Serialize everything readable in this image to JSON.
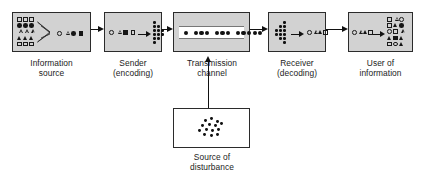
{
  "diagram": {
    "background": "#ffffff",
    "box_fill": "#d2d2d2",
    "box_fill_alt": "#ffffff",
    "stroke": "#2b2b2b",
    "glyph_color": "#151515"
  },
  "stages": [
    {
      "id": "information-source",
      "caption": "Information\nsource",
      "box": {
        "x": 12,
        "y": 12,
        "w": 79,
        "h": 40,
        "fill": "#d2d2d2"
      },
      "caption_pos": {
        "x": 12,
        "y": 58,
        "w": 79
      },
      "content_kind": "symbol-grid-funnel-stream",
      "grid": {
        "x": 4,
        "y": 4,
        "cols": 3,
        "rows": 5,
        "cell": 6.2,
        "symbols": [
          "sq-o",
          "sq-o",
          "sq-o",
          "ci-f",
          "ci-f",
          "ci-f",
          "tr-o",
          "tr-o",
          "tr-o",
          "tr-f",
          "tr-f",
          "tr-f",
          "sq-o",
          "sq-o",
          "sq-o"
        ]
      },
      "stream": [
        "ci-o",
        "tr-o",
        "ci-f",
        "sq-f"
      ]
    },
    {
      "id": "sender-encoding",
      "caption": "Sender\n(encoding)",
      "box": {
        "x": 104,
        "y": 12,
        "w": 58,
        "h": 40,
        "fill": "#d2d2d2"
      },
      "caption_pos": {
        "x": 104,
        "y": 58,
        "w": 58
      },
      "content_kind": "symbols-arrow-dotfan",
      "stream": [
        "ci-o",
        "tr-o",
        "sq-f",
        "sq-o"
      ],
      "fan_direction": "right"
    },
    {
      "id": "transmission-channel",
      "caption": "Transmission\nchannel",
      "box": {
        "x": 173,
        "y": 12,
        "w": 77,
        "h": 40,
        "fill": "#d2d2d2"
      },
      "caption_pos": {
        "x": 169,
        "y": 58,
        "w": 86
      },
      "content_kind": "signal-band",
      "dot_groups": [
        1,
        3,
        3,
        5
      ]
    },
    {
      "id": "receiver-decoding",
      "caption": "Receiver\n(decoding)",
      "box": {
        "x": 268,
        "y": 12,
        "w": 58,
        "h": 40,
        "fill": "#d2d2d2"
      },
      "caption_pos": {
        "x": 268,
        "y": 58,
        "w": 58
      },
      "content_kind": "dotfan-arrow-symbols",
      "stream": [
        "ci-o",
        "tr-o",
        "tr-f",
        "sq-o"
      ],
      "fan_direction": "left"
    },
    {
      "id": "user-of-information",
      "caption": "User of\ninformation",
      "box": {
        "x": 348,
        "y": 12,
        "w": 65,
        "h": 40,
        "fill": "#d2d2d2"
      },
      "caption_pos": {
        "x": 348,
        "y": 58,
        "w": 65
      },
      "content_kind": "symbols-arrow-grid",
      "stream": [
        "ci-o",
        "tr-o",
        "tr-f",
        "sq-o"
      ],
      "grid": {
        "x": 38,
        "y": 4,
        "cols": 3,
        "rows": 5,
        "cell": 6.2,
        "symbols": [
          "sq-o",
          "tr-o",
          "ci-o",
          "sq-o",
          "tr-f",
          "ci-f",
          "ci-o",
          "sq-o",
          "tr-o",
          "tr-f",
          "sq-f",
          "tr-f",
          "sq-o",
          "ci-o",
          "tr-f"
        ]
      }
    },
    {
      "id": "source-of-disturbance",
      "caption": "Source of\ndisturbance",
      "box": {
        "x": 173,
        "y": 108,
        "w": 77,
        "h": 40,
        "fill": "#ffffff"
      },
      "caption_pos": {
        "x": 169,
        "y": 152,
        "w": 86
      },
      "content_kind": "noise-cloud",
      "noise_dot_count": 14
    }
  ],
  "connectors": [
    {
      "id": "source-to-sender",
      "orientation": "horizontal",
      "x": 91,
      "y": 29,
      "length": 13
    },
    {
      "id": "sender-to-channel",
      "orientation": "horizontal",
      "x": 162,
      "y": 29,
      "length": 11
    },
    {
      "id": "channel-to-receiver",
      "orientation": "horizontal",
      "x": 250,
      "y": 29,
      "length": 18
    },
    {
      "id": "receiver-to-user",
      "orientation": "horizontal",
      "x": 326,
      "y": 29,
      "length": 22
    },
    {
      "id": "disturbance-to-channel",
      "orientation": "vertical-up",
      "x": 208,
      "y": 56,
      "length": 52
    }
  ]
}
